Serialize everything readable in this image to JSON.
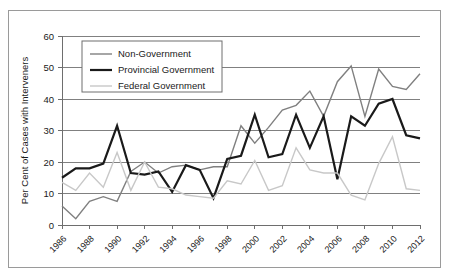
{
  "chart_data": {
    "type": "line",
    "title": "",
    "xlabel": "",
    "ylabel": "Per Cent of Cases with Interveners",
    "ylim": [
      0,
      60
    ],
    "ytick_labels": [
      "0",
      "10",
      "20",
      "30",
      "40",
      "50",
      "60"
    ],
    "yticks": [
      0,
      10,
      20,
      30,
      40,
      50,
      60
    ],
    "grid": true,
    "legend_position": "upper-left",
    "x": [
      1986,
      1987,
      1988,
      1989,
      1990,
      1991,
      1992,
      1993,
      1994,
      1995,
      1996,
      1997,
      1998,
      1999,
      2000,
      2001,
      2002,
      2003,
      2004,
      2005,
      2006,
      2007,
      2008,
      2009,
      2010,
      2011,
      2012
    ],
    "xtick_labels": [
      "1986",
      "1988",
      "1990",
      "1992",
      "1994",
      "1996",
      "1998",
      "2000",
      "2002",
      "2004",
      "2006",
      "2008",
      "2010",
      "2012"
    ],
    "xticks": [
      1986,
      1988,
      1990,
      1992,
      1994,
      1996,
      1998,
      2000,
      2002,
      2004,
      2006,
      2008,
      2010,
      2012
    ],
    "series": [
      {
        "name": "Non-Government",
        "color": "#808080",
        "width": 1.4,
        "values": [
          6,
          2,
          7.5,
          9,
          7.5,
          17,
          20,
          16.5,
          18.5,
          19,
          17.5,
          18.5,
          18.5,
          31.5,
          26,
          31,
          36.5,
          38,
          42.5,
          34.5,
          45.5,
          50.5,
          34.5,
          49.5,
          44,
          43,
          48
        ]
      },
      {
        "name": "Provincial Government",
        "color": "#1a1a1a",
        "width": 2.2,
        "values": [
          15,
          18,
          18,
          19.5,
          31.5,
          16.5,
          16,
          17,
          10.5,
          19,
          17.5,
          8.5,
          21,
          22,
          35,
          21.5,
          22.5,
          35,
          24.5,
          34.5,
          14.5,
          34.5,
          31.5,
          38.5,
          40,
          28.5,
          27.5
        ]
      },
      {
        "name": "Federal Government",
        "color": "#c8c8c8",
        "width": 1.4,
        "values": [
          13.5,
          11,
          16.5,
          12,
          23,
          11,
          20,
          12,
          11.5,
          9.5,
          9,
          8.5,
          14,
          13,
          20.5,
          11,
          12.5,
          24.5,
          17.5,
          16.5,
          16.5,
          9.5,
          8,
          19.5,
          28,
          11.5,
          11
        ]
      }
    ]
  },
  "legend": {
    "items": [
      {
        "label": "Non-Government"
      },
      {
        "label": "Provincial Government"
      },
      {
        "label": "Federal Government"
      }
    ]
  }
}
